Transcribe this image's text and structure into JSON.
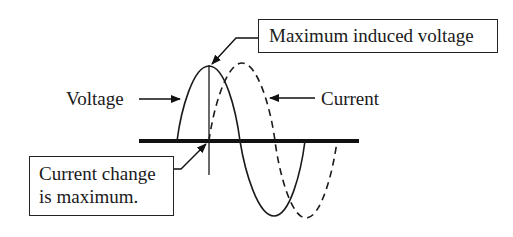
{
  "diagram": {
    "labels": {
      "voltage": "Voltage",
      "current": "Current",
      "max_induced_voltage": "Maximum induced voltage",
      "current_change_line1": "Current change",
      "current_change_line2": "is maximum."
    },
    "series": [
      {
        "name": "Voltage",
        "style": "solid",
        "color": "#1a1a1a"
      },
      {
        "name": "Current",
        "style": "dashed",
        "color": "#1a1a1a"
      }
    ],
    "colors": {
      "line": "#1a1a1a",
      "axis": "#111111",
      "background": "#ffffff"
    },
    "annotations": [
      {
        "text": "Maximum induced voltage",
        "points_to": "voltage peak"
      },
      {
        "text": "Current change is maximum.",
        "points_to": "current zero crossing"
      }
    ]
  }
}
